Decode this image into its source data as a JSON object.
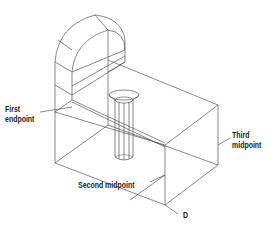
{
  "diagram": {
    "type": "isometric-wireframe",
    "line_color": "#555555",
    "labels": {
      "first_endpoint": [
        "First",
        "endpoint"
      ],
      "third_midpoint": [
        "Third",
        "midpoint"
      ],
      "second_midpoint": "Second midpoint",
      "d": "D"
    }
  }
}
